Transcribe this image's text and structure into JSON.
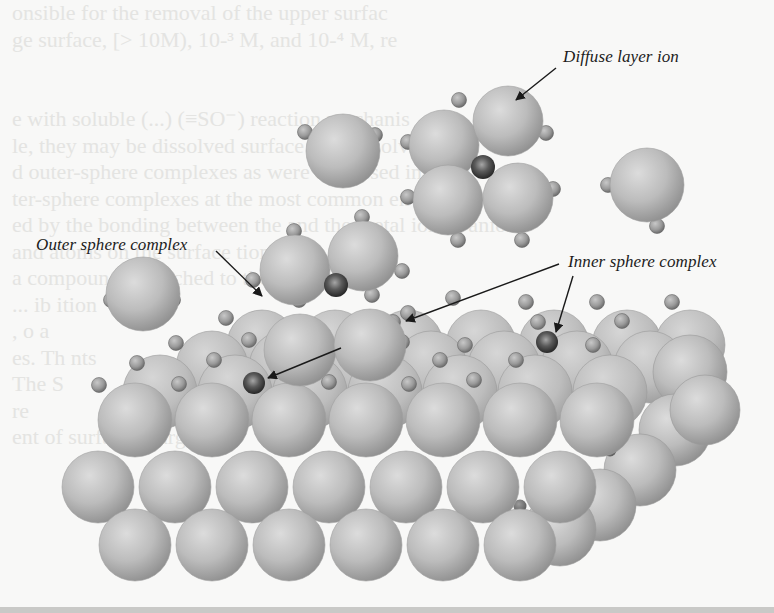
{
  "figure": {
    "labels": {
      "diffuse": "Diffuse layer ion",
      "outer": "Outer sphere complex",
      "inner": "Inner sphere complex"
    },
    "colors": {
      "background": "#f8f8f7",
      "oxygen_light": "#d9d9d9",
      "oxygen_mid": "#b3b3b3",
      "oxygen_dark": "#8e8e8e",
      "hydrogen_light": "#c4c4c4",
      "hydrogen_dark": "#6a6a6a",
      "metal_light": "#9a9a9a",
      "metal_dark": "#262626",
      "arrow": "#1a1a1a"
    },
    "ghost_text_lines": [
      "onsible for the removal of the upper surfac",
      "ge surface, [> 10M), 10-³ M, and 10-⁴ M, re",
      "",
      "",
      "e with soluble       (...)   (≡SO⁻) reaction mechanis",
      "le, they may be    dissolved   surface and dissolve  tween",
      "d outer-sphere  complexes  as were discussed in the  n",
      "ter-sphere complexes       at the most common en   ng",
      "ed by the bonding between the        and the metal ion or anion",
      "and atoms on the surface         tions with              of",
      "a compound  a             attached to  the surface  like  ",
      "            ...                             ib ition  ",
      "                       ,                           o  a",
      "es. Th                                           nts",
      "The                                               S",
      "re                                                 ",
      "                                                    ",
      "                                                    ",
      "                                                    ",
      "             ent of surface charge  t ut             ",
      "                                                    ",
      "                                                    "
    ],
    "surface": {
      "back_rows": [
        {
          "y": 345,
          "r": 35,
          "xs": [
            262,
            335,
            408,
            481,
            554,
            627,
            690
          ]
        },
        {
          "y": 367,
          "r": 36,
          "xs": [
            212,
            285,
            358,
            431,
            504,
            577,
            650
          ]
        },
        {
          "y": 392,
          "r": 37,
          "xs": [
            160,
            235,
            310,
            385,
            460,
            535,
            610
          ]
        }
      ],
      "front_rows": [
        {
          "y": 420,
          "r": 37,
          "xs": [
            135,
            212,
            289,
            366,
            443,
            520,
            597
          ]
        },
        {
          "y": 487,
          "r": 36,
          "xs": [
            98,
            175,
            252,
            329,
            406,
            483,
            560
          ]
        },
        {
          "y": 545,
          "r": 36,
          "xs": [
            135,
            212,
            289,
            366,
            443,
            520
          ]
        }
      ],
      "side_spheres": [
        {
          "x": 690,
          "y": 372,
          "r": 37
        },
        {
          "x": 675,
          "y": 430,
          "r": 36
        },
        {
          "x": 640,
          "y": 470,
          "r": 36
        },
        {
          "x": 600,
          "y": 505,
          "r": 36
        },
        {
          "x": 560,
          "y": 530,
          "r": 36
        },
        {
          "x": 705,
          "y": 410,
          "r": 35
        }
      ],
      "hydrogens": [
        {
          "x": 226,
          "y": 318
        },
        {
          "x": 299,
          "y": 300
        },
        {
          "x": 372,
          "y": 295
        },
        {
          "x": 453,
          "y": 298
        },
        {
          "x": 526,
          "y": 302
        },
        {
          "x": 597,
          "y": 302
        },
        {
          "x": 672,
          "y": 302
        },
        {
          "x": 176,
          "y": 343
        },
        {
          "x": 249,
          "y": 340
        },
        {
          "x": 316,
          "y": 344
        },
        {
          "x": 393,
          "y": 322
        },
        {
          "x": 465,
          "y": 345
        },
        {
          "x": 538,
          "y": 322
        },
        {
          "x": 622,
          "y": 321
        },
        {
          "x": 137,
          "y": 363
        },
        {
          "x": 214,
          "y": 360
        },
        {
          "x": 291,
          "y": 363
        },
        {
          "x": 357,
          "y": 363
        },
        {
          "x": 440,
          "y": 360
        },
        {
          "x": 516,
          "y": 360
        },
        {
          "x": 593,
          "y": 345
        },
        {
          "x": 99,
          "y": 385
        },
        {
          "x": 179,
          "y": 384
        },
        {
          "x": 329,
          "y": 382
        },
        {
          "x": 409,
          "y": 384
        },
        {
          "x": 474,
          "y": 380
        }
      ],
      "lattice_hydrogens_dark": [
        {
          "x": 137,
          "y": 405
        },
        {
          "x": 214,
          "y": 405
        },
        {
          "x": 291,
          "y": 405
        },
        {
          "x": 368,
          "y": 405
        },
        {
          "x": 445,
          "y": 405
        },
        {
          "x": 522,
          "y": 405
        },
        {
          "x": 174,
          "y": 468
        },
        {
          "x": 251,
          "y": 468
        },
        {
          "x": 328,
          "y": 468
        },
        {
          "x": 405,
          "y": 468
        },
        {
          "x": 482,
          "y": 468
        },
        {
          "x": 556,
          "y": 475
        },
        {
          "x": 610,
          "y": 450
        },
        {
          "x": 136,
          "y": 528
        },
        {
          "x": 213,
          "y": 528
        },
        {
          "x": 290,
          "y": 528
        },
        {
          "x": 367,
          "y": 528
        },
        {
          "x": 444,
          "y": 528
        },
        {
          "x": 520,
          "y": 506
        }
      ],
      "inner_complex_metals": [
        {
          "x": 254,
          "y": 383,
          "r": 11
        },
        {
          "x": 547,
          "y": 342,
          "r": 11
        }
      ]
    },
    "cluster_outer": {
      "spheres": [
        {
          "x": 300,
          "y": 350,
          "r": 36
        },
        {
          "x": 370,
          "y": 345,
          "r": 36
        },
        {
          "x": 295,
          "y": 270,
          "r": 35
        },
        {
          "x": 363,
          "y": 256,
          "r": 35
        }
      ],
      "metal": {
        "x": 336,
        "y": 285,
        "r": 12
      },
      "hydrogens": [
        {
          "x": 294,
          "y": 231
        },
        {
          "x": 362,
          "y": 217
        },
        {
          "x": 402,
          "y": 271
        },
        {
          "x": 253,
          "y": 280
        },
        {
          "x": 408,
          "y": 313
        },
        {
          "x": 402,
          "y": 342
        }
      ]
    },
    "cluster_diffuse": {
      "spheres": [
        {
          "x": 444,
          "y": 145,
          "r": 35
        },
        {
          "x": 508,
          "y": 121,
          "r": 35
        },
        {
          "x": 448,
          "y": 200,
          "r": 35
        },
        {
          "x": 518,
          "y": 198,
          "r": 35
        }
      ],
      "metal": {
        "x": 483,
        "y": 167,
        "r": 12
      },
      "hydrogens": [
        {
          "x": 459,
          "y": 100
        },
        {
          "x": 546,
          "y": 133
        },
        {
          "x": 408,
          "y": 142
        },
        {
          "x": 553,
          "y": 189
        },
        {
          "x": 408,
          "y": 197
        },
        {
          "x": 458,
          "y": 240
        },
        {
          "x": 522,
          "y": 240
        }
      ]
    },
    "free_waters": [
      {
        "x": 343,
        "y": 151,
        "r": 37,
        "h": [
          {
            "x": 305,
            "y": 132
          },
          {
            "x": 375,
            "y": 135
          }
        ]
      },
      {
        "x": 647,
        "y": 185,
        "r": 37,
        "h": [
          {
            "x": 608,
            "y": 185
          },
          {
            "x": 657,
            "y": 226
          }
        ]
      },
      {
        "x": 143,
        "y": 294,
        "r": 37,
        "h": [
          {
            "x": 111,
            "y": 300
          },
          {
            "x": 173,
            "y": 300
          }
        ]
      }
    ],
    "arrows": [
      {
        "from": {
          "x": 556,
          "y": 68
        },
        "to": {
          "x": 516,
          "y": 100
        }
      },
      {
        "from": {
          "x": 216,
          "y": 251
        },
        "to": {
          "x": 262,
          "y": 296
        }
      },
      {
        "from": {
          "x": 573,
          "y": 276
        },
        "to": {
          "x": 556,
          "y": 332
        }
      },
      {
        "from": {
          "x": 559,
          "y": 264
        },
        "to": {
          "x": 406,
          "y": 321
        }
      },
      {
        "from": {
          "x": 341,
          "y": 348
        },
        "to": {
          "x": 268,
          "y": 378
        }
      }
    ]
  }
}
